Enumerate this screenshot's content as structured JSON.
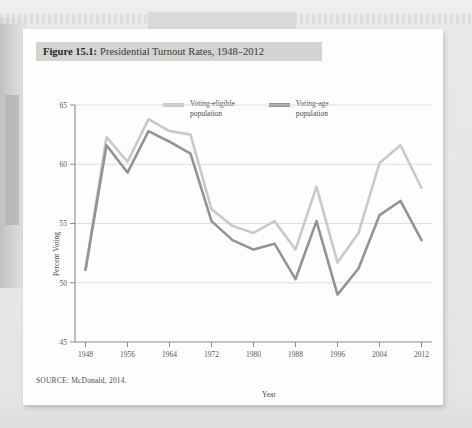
{
  "figure": {
    "number_label": "Figure 15.1:",
    "title_text": "Presidential Turnout Rates, 1948–2012",
    "source_note": "SOURCE: McDonald, 2014."
  },
  "colors": {
    "voting_eligible": "#c9c9c9",
    "voting_age": "#949494",
    "title_bar": "#d3d3d1",
    "grid": "#d8d8d8",
    "axis": "#8c8c8c",
    "card": "#fdfdfd",
    "page": "#e6e6e4"
  },
  "chart_data": {
    "type": "line",
    "title": "Presidential Turnout Rates, 1948–2012",
    "xlabel": "Year",
    "ylabel": "Percent Voting",
    "xlim": [
      1946,
      2014
    ],
    "ylim": [
      45,
      65
    ],
    "ytick_labels": [
      "45",
      "50",
      "55",
      "60",
      "65"
    ],
    "yticks": [
      45,
      50,
      55,
      60,
      65
    ],
    "xtick_labels": [
      "1948",
      "1956",
      "1964",
      "1972",
      "1980",
      "1988",
      "1996",
      "2004",
      "2012"
    ],
    "xticks": [
      1948,
      1956,
      1964,
      1972,
      1980,
      1988,
      1996,
      2004,
      2012
    ],
    "grid": true,
    "legend_position": "top",
    "x": [
      1948,
      1952,
      1956,
      1960,
      1964,
      1968,
      1972,
      1976,
      1980,
      1984,
      1988,
      1992,
      1996,
      2000,
      2004,
      2008,
      2012
    ],
    "series": [
      {
        "name": "Voting-eligible population",
        "color": "#c9c9c9",
        "values": [
          51.1,
          62.3,
          60.2,
          63.8,
          62.8,
          62.5,
          56.2,
          54.8,
          54.2,
          55.2,
          52.8,
          58.1,
          51.7,
          54.2,
          60.1,
          61.6,
          58.0
        ]
      },
      {
        "name": "Voting-age population",
        "color": "#949494",
        "values": [
          51.1,
          61.6,
          59.3,
          62.8,
          61.9,
          60.9,
          55.2,
          53.6,
          52.8,
          53.3,
          50.3,
          55.2,
          49.0,
          51.2,
          55.7,
          56.9,
          53.6
        ]
      }
    ]
  },
  "legend": {
    "entries": [
      {
        "label_line1": "Voting-eligible",
        "label_line2": "population",
        "color": "#c9c9c9"
      },
      {
        "label_line1": "Voting-age",
        "label_line2": "population",
        "color": "#949494"
      }
    ]
  }
}
